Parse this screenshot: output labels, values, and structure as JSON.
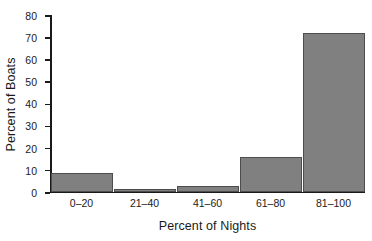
{
  "chart_data": {
    "type": "bar",
    "title": "",
    "xlabel": "Percent of Nights",
    "ylabel": "Percent of Boats",
    "categories": [
      "0–20",
      "21–40",
      "41–60",
      "61–80",
      "81–100"
    ],
    "values": [
      8.5,
      1.3,
      2.7,
      15.5,
      71.5
    ],
    "ylim": [
      0,
      80
    ],
    "yticks": [
      0,
      10,
      20,
      30,
      40,
      50,
      60,
      70,
      80
    ],
    "ytick_labels": [
      "0",
      "10",
      "20",
      "30",
      "40",
      "50",
      "60",
      "70",
      "80"
    ],
    "grid": false,
    "legend": false,
    "bar_color": "#808080",
    "bar_edge_color": "#4d4d4d",
    "axis_color": "#1a1a1a",
    "background_color": "#ffffff"
  }
}
